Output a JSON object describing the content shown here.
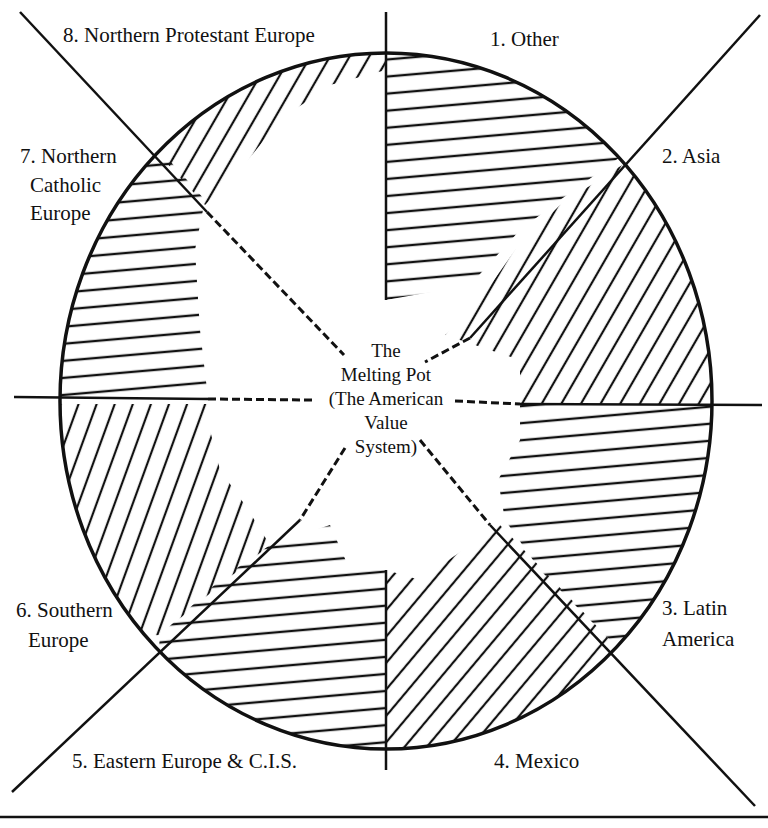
{
  "diagram": {
    "center": {
      "line1": "The",
      "line2": "Melting Pot",
      "line3": "(The American",
      "line4": "Value",
      "line5": "System)"
    },
    "segments": [
      {
        "number": "1.",
        "label": "Other",
        "lines": [
          "1.  Other"
        ],
        "hatch": "horizontal"
      },
      {
        "number": "2.",
        "label": "Asia",
        "lines": [
          "2.  Asia"
        ],
        "hatch": "diagonal"
      },
      {
        "number": "3.",
        "label": "Latin America",
        "lines": [
          "3.  Latin",
          "America"
        ],
        "hatch": "horizontal"
      },
      {
        "number": "4.",
        "label": "Mexico",
        "lines": [
          "4.  Mexico"
        ],
        "hatch": "diagonal"
      },
      {
        "number": "5.",
        "label": "Eastern Europe & C.I.S.",
        "lines": [
          "5.  Eastern Europe & C.I.S."
        ],
        "hatch": "horizontal"
      },
      {
        "number": "6.",
        "label": "Southern Europe",
        "lines": [
          "6.  Southern",
          "Europe"
        ],
        "hatch": "diagonal"
      },
      {
        "number": "7.",
        "label": "Northern Catholic Europe",
        "lines": [
          "7.  Northern",
          "Catholic",
          "Europe"
        ],
        "hatch": "horizontal"
      },
      {
        "number": "8.",
        "label": "Northern Protestant Europe",
        "lines": [
          "8.  Northern Protestant Europe"
        ],
        "hatch": "diagonal"
      }
    ],
    "colors": {
      "ink": "#111111",
      "background": "#ffffff"
    }
  }
}
